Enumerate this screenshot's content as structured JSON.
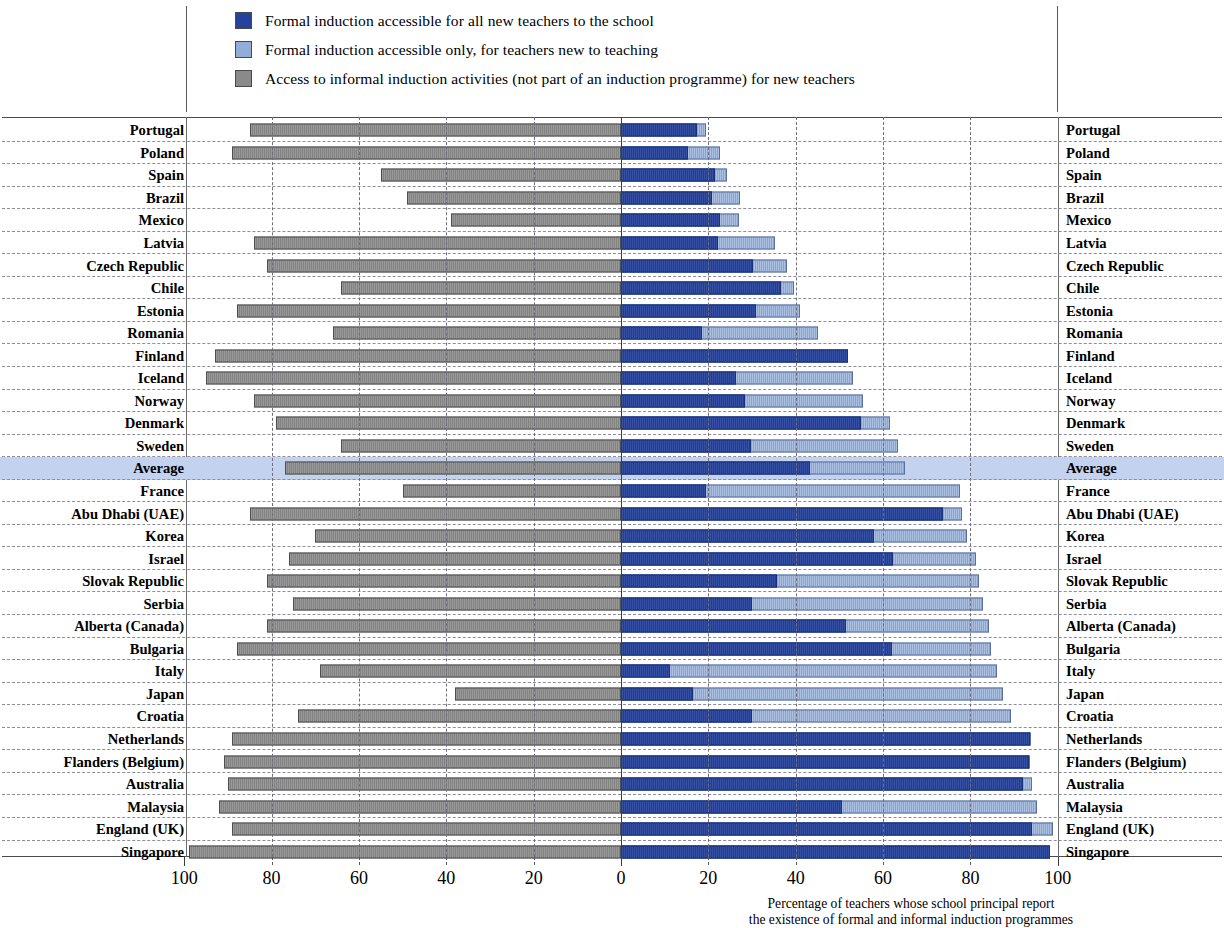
{
  "legend": {
    "items": [
      {
        "label": "Formal induction accessible for all new teachers to the school",
        "color": "#26439c",
        "key": "dark"
      },
      {
        "label": "Formal induction accessible only, for teachers new to teaching",
        "color": "#94add8",
        "key": "light"
      },
      {
        "label": "Access to informal induction activities (not part of an induction programme) for new teachers",
        "color": "#8a8a8a",
        "key": "gray"
      }
    ]
  },
  "axis": {
    "left_ticks": [
      "100",
      "80",
      "60",
      "40",
      "20"
    ],
    "zero": "0",
    "right_ticks": [
      "20",
      "40",
      "60",
      "80",
      "100"
    ],
    "caption_line1": "Percentage of teachers whose school principal report",
    "caption_line2": "the existence of formal and informal induction programmes"
  },
  "chart_data": {
    "type": "bar",
    "title": "",
    "xlabel": "Percentage of teachers whose school principal report the existence of formal and informal induction programmes",
    "ylabel": "",
    "orientation": "horizontal",
    "layout": "diverging-stacked",
    "xlim_left": [
      0,
      100
    ],
    "xlim_right": [
      0,
      100
    ],
    "grid": true,
    "legend_position": "top",
    "series": [
      {
        "name": "Formal induction accessible for all new teachers to the school",
        "key": "dark",
        "color": "#26439c",
        "side": "right"
      },
      {
        "name": "Formal induction accessible only, for teachers new to teaching",
        "key": "light",
        "color": "#94add8",
        "side": "right"
      },
      {
        "name": "Access to informal induction activities (not part of an induction programme) for new teachers",
        "key": "gray",
        "color": "#8a8a8a",
        "side": "left"
      }
    ],
    "categories": [
      "Portugal",
      "Poland",
      "Spain",
      "Brazil",
      "Mexico",
      "Latvia",
      "Czech Republic",
      "Chile",
      "Estonia",
      "Romania",
      "Finland",
      "Iceland",
      "Norway",
      "Denmark",
      "Sweden",
      "Average",
      "France",
      "Abu Dhabi (UAE)",
      "Korea",
      "Israel",
      "Slovak Republic",
      "Serbia",
      "Alberta (Canada)",
      "Bulgaria",
      "Italy",
      "Japan",
      "Croatia",
      "Netherlands",
      "Flanders (Belgium)",
      "Australia",
      "Malaysia",
      "England (UK)",
      "Singapore"
    ],
    "rows": [
      {
        "name": "Portugal",
        "informal": 85,
        "formal_all": 17.4,
        "formal_total": 19.5,
        "highlight": false
      },
      {
        "name": "Poland",
        "informal": 89,
        "formal_all": 15.3,
        "formal_total": 22.6,
        "highlight": false
      },
      {
        "name": "Spain",
        "informal": 55,
        "formal_all": 21.5,
        "formal_total": 24.2,
        "highlight": false
      },
      {
        "name": "Brazil",
        "informal": 49,
        "formal_all": 20.8,
        "formal_total": 27.2,
        "highlight": false
      },
      {
        "name": "Mexico",
        "informal": 39,
        "formal_all": 22.6,
        "formal_total": 27.0,
        "highlight": false
      },
      {
        "name": "Latvia",
        "informal": 84,
        "formal_all": 22.2,
        "formal_total": 35.2,
        "highlight": false
      },
      {
        "name": "Czech Republic",
        "informal": 81,
        "formal_all": 30.2,
        "formal_total": 38.0,
        "highlight": false
      },
      {
        "name": "Chile",
        "informal": 64,
        "formal_all": 36.6,
        "formal_total": 39.6,
        "highlight": false
      },
      {
        "name": "Estonia",
        "informal": 88,
        "formal_all": 30.9,
        "formal_total": 41.0,
        "highlight": false
      },
      {
        "name": "Romania",
        "informal": 66,
        "formal_all": 18.5,
        "formal_total": 45.1,
        "highlight": false
      },
      {
        "name": "Finland",
        "informal": 93,
        "formal_all": 52.0,
        "formal_total": 52.0,
        "highlight": false
      },
      {
        "name": "Iceland",
        "informal": 95,
        "formal_all": 26.3,
        "formal_total": 53.1,
        "highlight": false
      },
      {
        "name": "Norway",
        "informal": 84,
        "formal_all": 28.4,
        "formal_total": 55.4,
        "highlight": false
      },
      {
        "name": "Denmark",
        "informal": 79,
        "formal_all": 54.9,
        "formal_total": 61.5,
        "highlight": false
      },
      {
        "name": "Sweden",
        "informal": 64,
        "formal_all": 29.8,
        "formal_total": 63.4,
        "highlight": false
      },
      {
        "name": "Average",
        "informal": 77,
        "formal_all": 43.2,
        "formal_total": 65.0,
        "highlight": true
      },
      {
        "name": "France",
        "informal": 50,
        "formal_all": 19.4,
        "formal_total": 77.5,
        "highlight": false
      },
      {
        "name": "Abu Dhabi (UAE)",
        "informal": 85,
        "formal_all": 73.7,
        "formal_total": 78.0,
        "highlight": false
      },
      {
        "name": "Korea",
        "informal": 70,
        "formal_all": 57.9,
        "formal_total": 79.2,
        "highlight": false
      },
      {
        "name": "Israel",
        "informal": 76,
        "formal_all": 62.2,
        "formal_total": 81.3,
        "highlight": false
      },
      {
        "name": "Slovak Republic",
        "informal": 81,
        "formal_all": 35.6,
        "formal_total": 81.9,
        "highlight": false
      },
      {
        "name": "Serbia",
        "informal": 75,
        "formal_all": 30.1,
        "formal_total": 82.9,
        "highlight": false
      },
      {
        "name": "Alberta (Canada)",
        "informal": 81,
        "formal_all": 51.5,
        "formal_total": 84.3,
        "highlight": false
      },
      {
        "name": "Bulgaria",
        "informal": 88,
        "formal_all": 62.0,
        "formal_total": 84.8,
        "highlight": false
      },
      {
        "name": "Italy",
        "informal": 69,
        "formal_all": 11.2,
        "formal_total": 86.0,
        "highlight": false
      },
      {
        "name": "Japan",
        "informal": 38,
        "formal_all": 16.5,
        "formal_total": 87.4,
        "highlight": false
      },
      {
        "name": "Croatia",
        "informal": 74,
        "formal_all": 30.0,
        "formal_total": 89.3,
        "highlight": false
      },
      {
        "name": "Netherlands",
        "informal": 89,
        "formal_all": 93.6,
        "formal_total": 93.8,
        "highlight": false
      },
      {
        "name": "Flanders (Belgium)",
        "informal": 91,
        "formal_all": 93.4,
        "formal_total": 93.6,
        "highlight": false
      },
      {
        "name": "Australia",
        "informal": 90,
        "formal_all": 92.0,
        "formal_total": 94.2,
        "highlight": false
      },
      {
        "name": "Malaysia",
        "informal": 92,
        "formal_all": 50.5,
        "formal_total": 95.2,
        "highlight": false
      },
      {
        "name": "England (UK)",
        "informal": 89,
        "formal_all": 94.0,
        "formal_total": 98.8,
        "highlight": false
      },
      {
        "name": "Singapore",
        "informal": 99,
        "formal_all": 98.2,
        "formal_total": 98.2,
        "highlight": false
      }
    ]
  }
}
